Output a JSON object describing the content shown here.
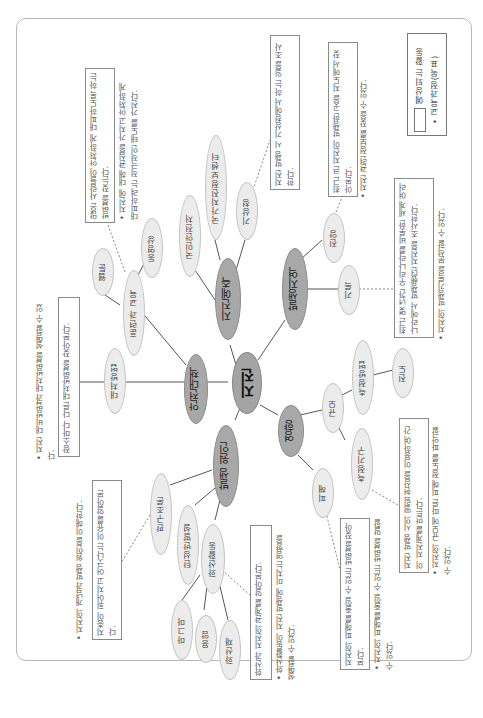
{
  "orientation": "rotated 90 degrees clockwise",
  "legend": {
    "curriculum": "• 교육과정(목표)",
    "expected": "예상되는 활동"
  },
  "center": "지진",
  "branches": {
    "prediction": {
      "label": "지진예측",
      "children": [
        "국민안전처",
        "국가지진정보센터",
        "기상청"
      ]
    },
    "region": {
      "label": "발생지역",
      "children": [
        "진앙",
        "기록"
      ]
    },
    "safety": {
      "label": "안전대책",
      "children": [
        "대처방법",
        "훈련과 교육"
      ],
      "grandchildren": [
        "웹툰",
        "동영상"
      ]
    },
    "cause": {
      "label": "발생 원인",
      "children": [
        "판구조론",
        "탄성반발설",
        "화산활동"
      ],
      "grandchildren": [
        "마그마",
        "용암",
        "화산재"
      ]
    },
    "impact": {
      "label": "영향",
      "children": [
        "규모",
        "피해"
      ],
      "scale_children": [
        "측정방법",
        "측정기구"
      ],
      "method_child": "진도"
    }
  },
  "boxes": {
    "training": "많은 사람들이 안전하게 대피하도록 하는 방법을 찾는다.",
    "weather": "지진 발생 시 기상청에서 하는 일을 조사한다.",
    "epicenter": "최근 큰 지진이 발생한 곳을 지도에서 찾아본다.",
    "record": "최근 몇 년간 우리나라를 비롯한 세계 여러 나라에서 발생했던 지진을 조사한다.",
    "method": "장소마다 다른 대처방법을 찾아본다.",
    "plate": "지층이 휘어지고 어긋나는 이유를 알아본다.",
    "volcano": "화산과 지진의 관계를 알아본다.",
    "damage": "지진의 피해를 줄일 수 있는 방법을 찾아본다.",
    "instrument": "지진 발생 시의 떨림 현상을 이용하여 간이 지진계를 만든다."
  },
  "notes": {
    "training": "• 지진에 대해 관심을 가지고 안전하게 대피하려는 적극적인 태도를 가진다.",
    "epicenter": "• 지진 관련 정보를 찾을 수 있다.",
    "record": "• 지진의 발생기록을 분석할 수 있다.",
    "method": "• 지진 대비방법과 대처방법을 설명할 수 있다.",
    "plate": "• 지진의 개념과 발생 원인을 이해한다.",
    "volcano": "• 화산활동이 지진 발생에 미치는 영향을 설명할 수 있다.",
    "damage": "• 지진의 피해를 줄일 수 있는 방법을 말할 수 있다.",
    "instrument": "• 지진의 규모에 따른 피해 정도를 파악할 수 있다."
  }
}
